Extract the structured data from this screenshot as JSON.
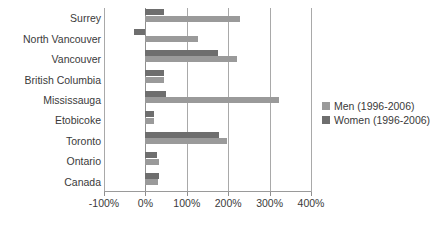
{
  "chart_data": {
    "type": "bar",
    "orientation": "horizontal",
    "title": "",
    "xlabel": "",
    "ylabel": "",
    "xlim": [
      -100,
      400
    ],
    "xticks": [
      -100,
      0,
      100,
      200,
      300,
      400
    ],
    "xticklabels": [
      "-100%",
      "0%",
      "100%",
      "200%",
      "300%",
      "400%"
    ],
    "grid": true,
    "grid_axis": "x",
    "legend_position": "right",
    "categories": [
      "Surrey",
      "North Vancouver",
      "Vancouver",
      "British Columbia",
      "Mississauga",
      "Etobicoke",
      "Toronto",
      "Ontario",
      "Canada"
    ],
    "series": [
      {
        "name": "Men (1996-2006)",
        "color": "#9a9a9a",
        "values": [
          228,
          126,
          222,
          44,
          322,
          20,
          196,
          34,
          30
        ]
      },
      {
        "name": "Women (1996-2006)",
        "color": "#6e6e6e",
        "values": [
          44,
          -28,
          176,
          44,
          50,
          22,
          178,
          28,
          32
        ]
      }
    ]
  },
  "legend": {
    "items": [
      {
        "label": "Men (1996-2006)",
        "color": "#9a9a9a"
      },
      {
        "label": "Women (1996-2006)",
        "color": "#6e6e6e"
      }
    ]
  },
  "colors": {
    "men": "#9a9a9a",
    "women": "#6e6e6e",
    "grid": "#a9a9a9",
    "axis": "#8f8f8f",
    "text": "#3a3a3a",
    "background": "#ffffff"
  }
}
